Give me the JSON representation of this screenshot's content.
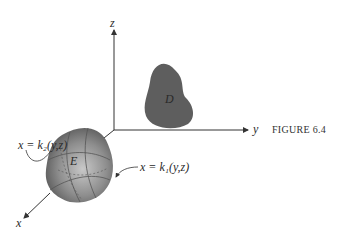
{
  "figure": {
    "caption": "FIGURE 6.4",
    "axes": {
      "z": "z",
      "y": "y",
      "x": "x"
    },
    "regions": {
      "solid": "E",
      "projection": "D"
    },
    "surfaces": {
      "back": "x = k₂(y,z)",
      "front": "x = k₁(y,z)"
    },
    "colors": {
      "projection_fill": "#5e5e5e",
      "solid_fill": "#8a8a8a",
      "axis": "#333333"
    }
  }
}
